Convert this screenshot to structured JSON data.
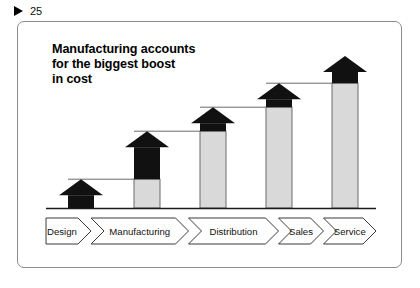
{
  "slide": {
    "marker_icon": "play-triangle-icon",
    "number": "25"
  },
  "title": "Manufacturing accounts\nfor the biggest boost\nin cost",
  "colors": {
    "increment": "#111111",
    "base": "#d9d9d9",
    "outline": "#6b6b6b",
    "baseline": "#1a1a1a",
    "connector": "#6b6b6b",
    "frame": "#8c8c8c",
    "text": "#000000"
  },
  "chart_data": {
    "type": "bar",
    "title": "Manufacturing accounts for the biggest boost in cost",
    "xlabel": "",
    "ylabel": "Cumulative cost",
    "categories": [
      "Design",
      "Manufacturing",
      "Distribution",
      "Sales",
      "Service"
    ],
    "series": [
      {
        "name": "Carried-forward cost",
        "values": [
          0,
          18,
          48,
          63,
          78
        ]
      },
      {
        "name": "Added cost",
        "values": [
          18,
          30,
          15,
          15,
          17
        ]
      }
    ],
    "cumulative": [
      18,
      48,
      63,
      78,
      95
    ],
    "ylim": [
      0,
      100
    ],
    "grid": false,
    "legend": "none",
    "stacked": true
  },
  "stages": [
    {
      "label": "Design",
      "base": 0,
      "increment": 18,
      "total": 18
    },
    {
      "label": "Manufacturing",
      "base": 18,
      "increment": 30,
      "total": 48
    },
    {
      "label": "Distribution",
      "base": 48,
      "increment": 15,
      "total": 63
    },
    {
      "label": "Sales",
      "base": 63,
      "increment": 15,
      "total": 78
    },
    {
      "label": "Service",
      "base": 78,
      "increment": 17,
      "total": 95
    }
  ]
}
